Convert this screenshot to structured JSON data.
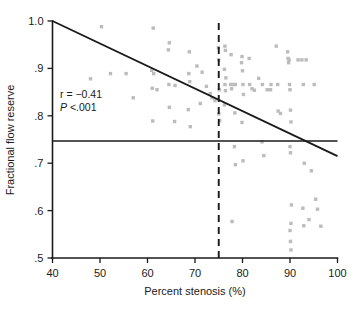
{
  "figure": {
    "background_color": "#ffffff",
    "point_color": "#bcbcbc",
    "line_color": "#1a1a1a"
  },
  "annotations": {
    "r_label": "r = −0.41",
    "p_label": "P <.001",
    "p_italic_part": "P",
    "p_rest": " <.001"
  },
  "chart_data": {
    "type": "scatter",
    "title": "",
    "xlabel": "Percent stenosis (%)",
    "ylabel": "Fractional flow reserve",
    "xlim": [
      40,
      100
    ],
    "ylim": [
      0.5,
      1.0
    ],
    "xticks": [
      40,
      50,
      60,
      70,
      80,
      90,
      100
    ],
    "xticklabels": [
      "40",
      "50",
      "60",
      "70",
      "80",
      "90",
      "100"
    ],
    "yticks": [
      0.5,
      0.6,
      0.7,
      0.8,
      0.9,
      1.0
    ],
    "yticklabels": [
      ".5",
      ".6",
      ".7",
      ".8",
      ".9",
      "1.0"
    ],
    "grid": false,
    "legend": false,
    "annotations": {
      "correlation_r": -0.41,
      "p_value": "<.001"
    },
    "regression_line": {
      "label": "regression line",
      "x": [
        40,
        100
      ],
      "y": [
        1.0,
        0.715
      ],
      "style": "solid"
    },
    "reference_lines": [
      {
        "label": "ffr-cutoff",
        "orientation": "horizontal",
        "value": 0.747,
        "style": "solid",
        "x_from": 40,
        "x_to": 100
      },
      {
        "label": "stenosis-cutoff",
        "orientation": "vertical",
        "value": 75,
        "style": "dashed",
        "y_from": 0.5,
        "y_to": 1.0
      }
    ],
    "points": [
      [
        50.3,
        0.988
      ],
      [
        48.0,
        0.878
      ],
      [
        52.2,
        0.889
      ],
      [
        55.5,
        0.889
      ],
      [
        57.0,
        0.838
      ],
      [
        61.2,
        0.985
      ],
      [
        60.9,
        0.896
      ],
      [
        61.3,
        0.889
      ],
      [
        61.0,
        0.858
      ],
      [
        61.1,
        0.789
      ],
      [
        64.6,
        0.954
      ],
      [
        64.4,
        0.939
      ],
      [
        64.5,
        0.866
      ],
      [
        64.6,
        0.818
      ],
      [
        65.8,
        0.864
      ],
      [
        65.7,
        0.788
      ],
      [
        68.8,
        0.935
      ],
      [
        68.7,
        0.889
      ],
      [
        68.9,
        0.872
      ],
      [
        68.6,
        0.813
      ],
      [
        69.0,
        0.777
      ],
      [
        70.4,
        0.905
      ],
      [
        71.1,
        0.826
      ],
      [
        72.4,
        0.862
      ],
      [
        73.2,
        0.847
      ],
      [
        73.6,
        0.838
      ],
      [
        74.2,
        0.832
      ],
      [
        74.9,
        0.944
      ],
      [
        75.0,
        0.918
      ],
      [
        75.1,
        0.855
      ],
      [
        75.0,
        0.804
      ],
      [
        75.2,
        0.79
      ],
      [
        76.3,
        0.947
      ],
      [
        76.4,
        0.938
      ],
      [
        76.2,
        0.898
      ],
      [
        76.5,
        0.88
      ],
      [
        76.3,
        0.866
      ],
      [
        76.4,
        0.853
      ],
      [
        76.2,
        0.823
      ],
      [
        77.6,
        0.929
      ],
      [
        77.5,
        0.866
      ],
      [
        77.7,
        0.857
      ],
      [
        78.0,
        0.866
      ],
      [
        78.5,
        0.866
      ],
      [
        78.4,
        0.806
      ],
      [
        78.3,
        0.735
      ],
      [
        78.5,
        0.697
      ],
      [
        79.9,
        0.925
      ],
      [
        79.8,
        0.912
      ],
      [
        80.0,
        0.895
      ],
      [
        80.1,
        0.866
      ],
      [
        80.2,
        0.845
      ],
      [
        79.9,
        0.786
      ],
      [
        80.1,
        0.705
      ],
      [
        81.4,
        0.921
      ],
      [
        81.5,
        0.866
      ],
      [
        82.0,
        0.857
      ],
      [
        82.5,
        0.854
      ],
      [
        83.4,
        0.879
      ],
      [
        84.2,
        0.866
      ],
      [
        84.1,
        0.745
      ],
      [
        84.5,
        0.716
      ],
      [
        85.2,
        0.855
      ],
      [
        85.9,
        0.855
      ],
      [
        86.0,
        0.866
      ],
      [
        87.1,
        0.947
      ],
      [
        87.4,
        0.866
      ],
      [
        87.5,
        0.81
      ],
      [
        88.0,
        0.805
      ],
      [
        89.5,
        0.935
      ],
      [
        89.6,
        0.921
      ],
      [
        89.7,
        0.912
      ],
      [
        89.8,
        0.918
      ],
      [
        89.9,
        0.866
      ],
      [
        90.0,
        0.855
      ],
      [
        90.1,
        0.812
      ],
      [
        90.2,
        0.787
      ],
      [
        90.0,
        0.735
      ],
      [
        90.1,
        0.722
      ],
      [
        90.3,
        0.612
      ],
      [
        90.2,
        0.573
      ],
      [
        90.0,
        0.558
      ],
      [
        90.1,
        0.535
      ],
      [
        90.2,
        0.517
      ],
      [
        91.7,
        0.918
      ],
      [
        92.5,
        0.918
      ],
      [
        93.4,
        0.918
      ],
      [
        92.8,
        0.866
      ],
      [
        93.0,
        0.7
      ],
      [
        92.7,
        0.605
      ],
      [
        92.9,
        0.568
      ],
      [
        94.0,
        0.581
      ],
      [
        94.5,
        0.684
      ],
      [
        95.1,
        0.866
      ],
      [
        95.4,
        0.624
      ],
      [
        95.8,
        0.603
      ],
      [
        96.5,
        0.567
      ],
      [
        77.8,
        0.577
      ],
      [
        62.0,
        0.855
      ],
      [
        71.5,
        0.892
      ]
    ]
  }
}
